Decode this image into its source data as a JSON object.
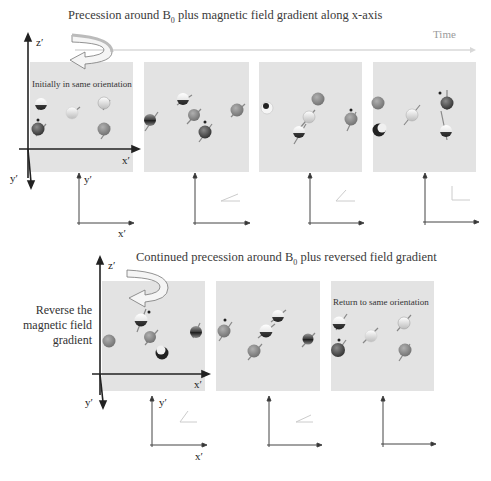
{
  "top_section": {
    "title_pre": "Precession around B",
    "title_sub": "0",
    "title_post": " plus magnetic field gradient along x-axis",
    "time_label": "Time",
    "panel_caption": "Initially in same orientation",
    "axes": {
      "z": "z′",
      "x": "x′",
      "y": "y′"
    },
    "panels": [
      {
        "id": 1,
        "phase_angle_deg": 0
      },
      {
        "id": 2,
        "phase_angle_deg": 20
      },
      {
        "id": 3,
        "phase_angle_deg": 45
      },
      {
        "id": 4,
        "phase_angle_deg": 90
      }
    ]
  },
  "bottom_section": {
    "title_pre": "Continued precession around B",
    "title_sub": "0",
    "title_post": " plus reversed field gradient",
    "side_label_lines": [
      "Reverse the",
      "magnetic field",
      "gradient"
    ],
    "panel_caption": "Return to same orientation",
    "axes": {
      "z": "z′",
      "x": "x′",
      "y": "y′"
    },
    "panels": [
      {
        "id": 1,
        "phase_angle_deg": 45
      },
      {
        "id": 2,
        "phase_angle_deg": 20
      },
      {
        "id": 3,
        "phase_angle_deg": 0
      }
    ]
  },
  "colors": {
    "panel_bg": "#e3e3e3",
    "axis": "#222222",
    "arrow_light": "#d0d0d0",
    "spin_dark": "#3c3c3c",
    "spin_mid": "#8a8a8a",
    "spin_light": "#f2f2f2"
  }
}
